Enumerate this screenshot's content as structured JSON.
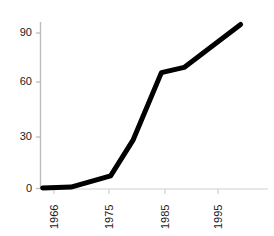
{
  "chart_data": {
    "type": "line",
    "title": "",
    "subtitle": "",
    "xlabel": "",
    "ylabel": "",
    "x": [
      1964,
      1969,
      1976,
      1980,
      1985,
      1989,
      1999
    ],
    "values": [
      0,
      0.5,
      7,
      28,
      67,
      70,
      95
    ],
    "series": [
      {
        "name": "series-1",
        "x": [
          1964,
          1969,
          1976,
          1980,
          1985,
          1989,
          1999
        ],
        "values": [
          0,
          0.5,
          7,
          28,
          67,
          70,
          95
        ]
      }
    ],
    "xlim": [
      1964,
      1999
    ],
    "ylim": [
      0,
      96
    ],
    "x_ticks": [
      1966,
      1975,
      1985,
      1995
    ],
    "x_tick_labels": [
      "1966",
      "1975",
      "1985",
      "1995"
    ],
    "y_ticks": [
      0,
      30,
      60,
      90
    ],
    "y_tick_labels": [
      "0",
      "30",
      "60",
      "90"
    ],
    "grid": false,
    "legend": null,
    "legend_position": "none",
    "line_color": "#000000",
    "line_width": 5,
    "axis_color": "#b8b8b8",
    "tick_label_color": "#1a1a1a",
    "background_color": "#ffffff",
    "x_tick_rotation": 90,
    "annotations": []
  },
  "axes": {
    "y_labels": [
      {
        "text": "90",
        "value": 90
      },
      {
        "text": "60",
        "value": 60
      },
      {
        "text": "30",
        "value": 30
      },
      {
        "text": "0",
        "value": 0
      }
    ],
    "x_labels": [
      {
        "text": "1966",
        "value": 1966
      },
      {
        "text": "1975",
        "value": 1975
      },
      {
        "text": "1985",
        "value": 1985
      },
      {
        "text": "1995",
        "value": 1995
      }
    ]
  }
}
